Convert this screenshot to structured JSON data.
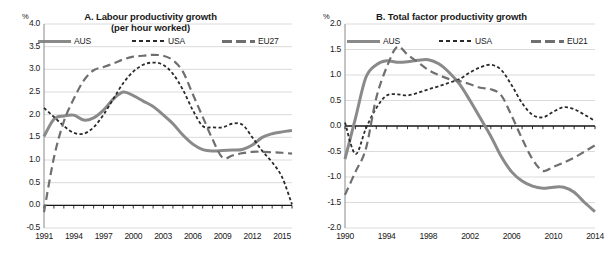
{
  "figure": {
    "panels": [
      {
        "id": "A",
        "title_line1": "A. Labour productivity growth",
        "title_line2": "(per hour worked)",
        "unit_label": "%",
        "legend": [
          {
            "name": "AUS",
            "style": "solid",
            "color": "#8a8a8a"
          },
          {
            "name": "USA",
            "style": "dotted",
            "color": "#2b2b2b"
          },
          {
            "name": "EU27",
            "style": "dashed",
            "color": "#6f6f6f"
          }
        ]
      },
      {
        "id": "B",
        "title_line1": "B. Total factor productivity growth",
        "title_line2": "",
        "unit_label": "%",
        "legend": [
          {
            "name": "AUS",
            "style": "solid",
            "color": "#8a8a8a"
          },
          {
            "name": "USA",
            "style": "dotted",
            "color": "#2b2b2b"
          },
          {
            "name": "EU21",
            "style": "dashed",
            "color": "#6f6f6f"
          }
        ]
      }
    ]
  },
  "chart_data": [
    {
      "type": "line",
      "title": "A. Labour productivity growth (per hour worked)",
      "xlabel": "",
      "ylabel": "%",
      "ylim": [
        -0.5,
        4.0
      ],
      "yticks": [
        "4.0",
        "3.5",
        "3.0",
        "2.5",
        "2.0",
        "1.5",
        "1.0",
        "0.5",
        "0.0",
        "-0.5"
      ],
      "ytick_values": [
        4.0,
        3.5,
        3.0,
        2.5,
        2.0,
        1.5,
        1.0,
        0.5,
        0.0,
        -0.5
      ],
      "xlim": [
        1991,
        2016
      ],
      "xticks": [
        "1991",
        "1994",
        "1997",
        "2000",
        "2003",
        "2006",
        "2009",
        "2012",
        "2015"
      ],
      "xtick_values": [
        1991,
        1994,
        1997,
        2000,
        2003,
        2006,
        2009,
        2012,
        2015
      ],
      "grid": "horizontal",
      "legend_position": "top",
      "x": [
        1991,
        1992,
        1993,
        1994,
        1995,
        1996,
        1997,
        1998,
        1999,
        2000,
        2001,
        2002,
        2003,
        2004,
        2005,
        2006,
        2007,
        2008,
        2009,
        2010,
        2011,
        2012,
        2013,
        2014,
        2015,
        2016
      ],
      "series": [
        {
          "name": "AUS",
          "style": "solid",
          "color": "#8a8a8a",
          "values": [
            1.52,
            1.9,
            1.97,
            1.99,
            1.88,
            1.93,
            2.1,
            2.35,
            2.5,
            2.42,
            2.3,
            2.18,
            2.0,
            1.8,
            1.55,
            1.35,
            1.23,
            1.2,
            1.21,
            1.22,
            1.23,
            1.33,
            1.5,
            1.58,
            1.62,
            1.65
          ]
        },
        {
          "name": "USA",
          "style": "dotted",
          "color": "#2b2b2b",
          "values": [
            2.15,
            1.95,
            1.75,
            1.6,
            1.58,
            1.72,
            2.0,
            2.35,
            2.7,
            2.95,
            3.1,
            3.15,
            3.1,
            2.9,
            2.55,
            2.1,
            1.75,
            1.72,
            1.72,
            1.8,
            1.78,
            1.5,
            1.2,
            0.95,
            0.62,
            0.02
          ]
        },
        {
          "name": "EU27",
          "style": "dashed",
          "color": "#6f6f6f",
          "values": [
            -0.15,
            1.05,
            1.85,
            2.35,
            2.75,
            2.98,
            3.05,
            3.13,
            3.22,
            3.28,
            3.3,
            3.32,
            3.3,
            3.2,
            2.95,
            2.45,
            1.95,
            1.45,
            1.05,
            1.1,
            1.15,
            1.18,
            1.18,
            1.17,
            1.16,
            1.14
          ]
        }
      ]
    },
    {
      "type": "line",
      "title": "B. Total factor productivity growth",
      "xlabel": "",
      "ylabel": "%",
      "ylim": [
        -2.0,
        2.0
      ],
      "yticks": [
        "2.0",
        "1.5",
        "1.0",
        "0.5",
        "0.0",
        "-0.5",
        "-1.0",
        "-1.5",
        "-2.0"
      ],
      "ytick_values": [
        2.0,
        1.5,
        1.0,
        0.5,
        0.0,
        -0.5,
        -1.0,
        -1.5,
        -2.0
      ],
      "xlim": [
        1990,
        2014
      ],
      "xticks": [
        "1990",
        "1994",
        "1998",
        "2002",
        "2006",
        "2010",
        "2014"
      ],
      "xtick_values": [
        1990,
        1994,
        1998,
        2002,
        2006,
        2010,
        2014
      ],
      "grid": "horizontal",
      "legend_position": "top",
      "x": [
        1990,
        1991,
        1992,
        1993,
        1994,
        1995,
        1996,
        1997,
        1998,
        1999,
        2000,
        2001,
        2002,
        2003,
        2004,
        2005,
        2006,
        2007,
        2008,
        2009,
        2010,
        2011,
        2012,
        2013,
        2014
      ],
      "series": [
        {
          "name": "AUS",
          "style": "solid",
          "color": "#8a8a8a",
          "values": [
            -0.65,
            0.15,
            0.95,
            1.2,
            1.28,
            1.25,
            1.26,
            1.29,
            1.3,
            1.22,
            1.05,
            0.82,
            0.5,
            0.15,
            -0.2,
            -0.6,
            -0.9,
            -1.08,
            -1.18,
            -1.22,
            -1.2,
            -1.2,
            -1.3,
            -1.5,
            -1.68
          ]
        },
        {
          "name": "USA",
          "style": "dotted",
          "color": "#2b2b2b",
          "values": [
            0.07,
            -0.55,
            -0.05,
            0.35,
            0.6,
            0.62,
            0.6,
            0.65,
            0.72,
            0.78,
            0.85,
            0.92,
            1.05,
            1.15,
            1.2,
            1.1,
            0.8,
            0.45,
            0.22,
            0.17,
            0.28,
            0.37,
            0.33,
            0.22,
            0.1
          ]
        },
        {
          "name": "EU21",
          "style": "dashed",
          "color": "#6f6f6f",
          "values": [
            -1.35,
            -0.9,
            -0.45,
            0.55,
            1.15,
            1.55,
            1.4,
            1.25,
            1.1,
            1.0,
            0.92,
            0.88,
            0.82,
            0.75,
            0.72,
            0.6,
            0.2,
            -0.25,
            -0.65,
            -0.88,
            -0.8,
            -0.72,
            -0.62,
            -0.5,
            -0.38
          ]
        }
      ]
    }
  ]
}
